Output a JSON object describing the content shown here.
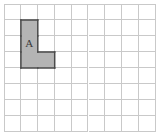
{
  "figure": {
    "background_color": "#ffffff"
  },
  "grid": {
    "columns": 9,
    "rows": 8,
    "cell_width": 16.9,
    "cell_height": 16.0,
    "origin_x": 4,
    "origin_y": 4,
    "line_color": "#c9c9c9",
    "line_width": 1
  },
  "shape": {
    "label": "A",
    "label_color": "#3a3a3a",
    "fill_color": "#b4b4b4",
    "outline_color": "#4a4a4a",
    "outline_width": 1.5,
    "description": "L-shaped polyomino of 4 unit squares",
    "area_squares": 4,
    "cells": [
      {
        "col": 1,
        "row": 1
      },
      {
        "col": 1,
        "row": 2
      },
      {
        "col": 1,
        "row": 3
      },
      {
        "col": 2,
        "row": 3
      }
    ],
    "label_cell": {
      "col": 1,
      "row": 2
    }
  }
}
